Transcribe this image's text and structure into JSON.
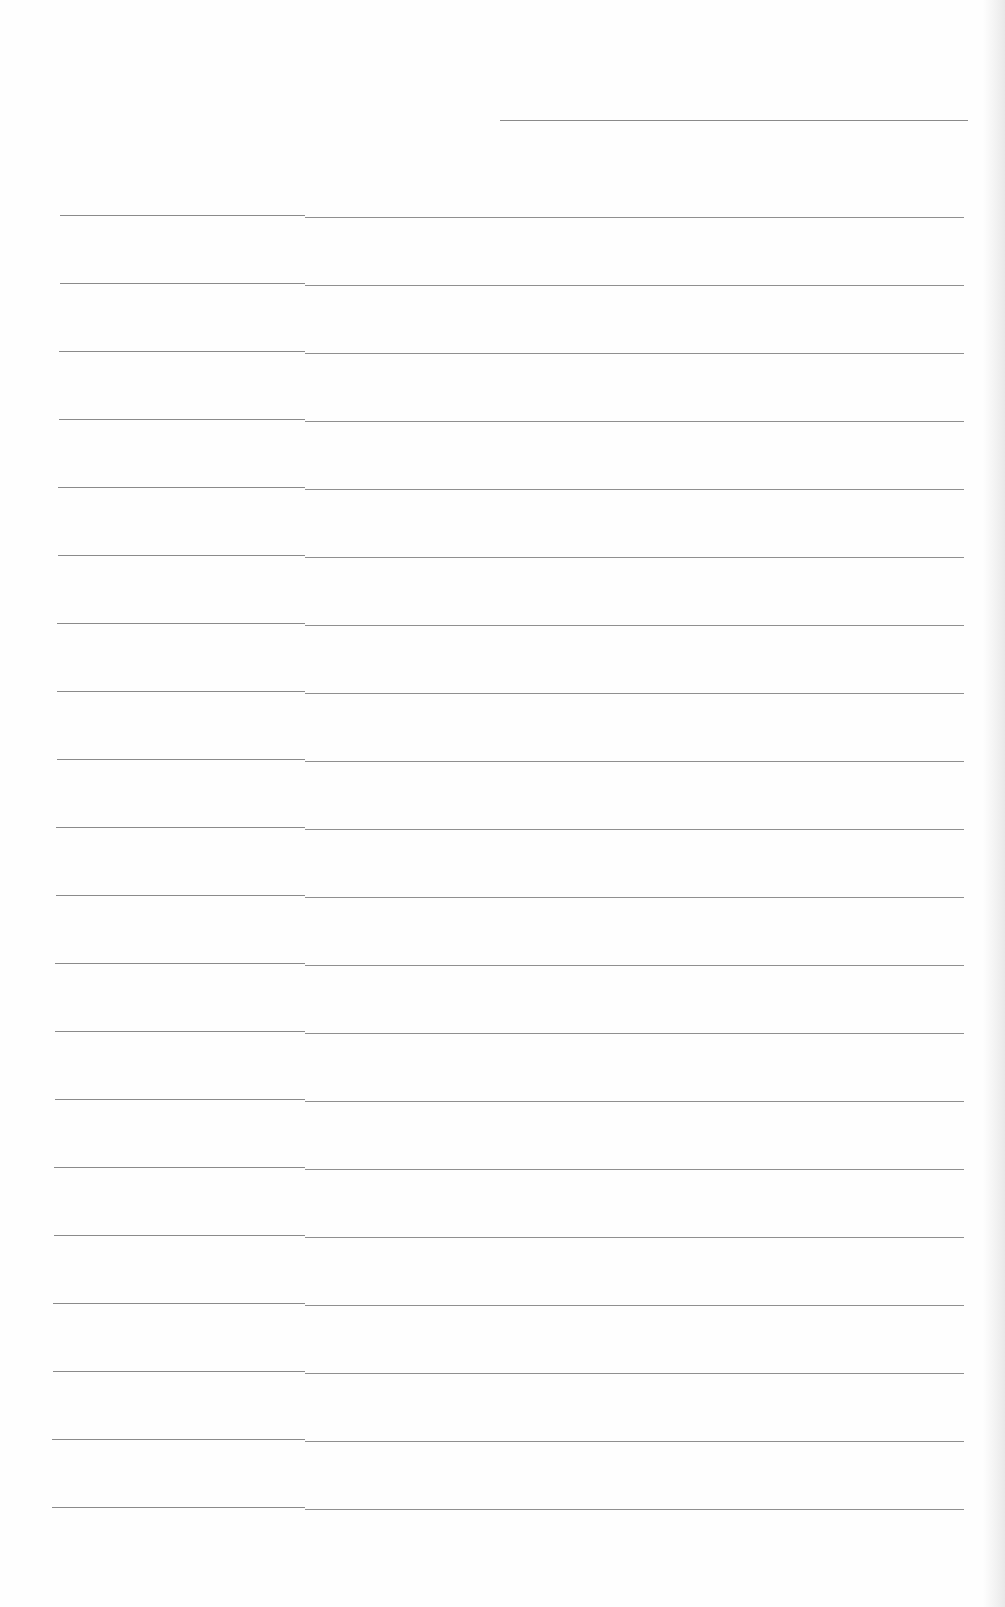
{
  "document": {
    "type": "lined-paper",
    "background": "#fefefe",
    "line_color": "#8a8a8a",
    "header_rule": {
      "x1": 500,
      "x2": 968,
      "y": 120
    },
    "rules": {
      "count": 20,
      "first_y": 215,
      "spacing": 68,
      "left_x_top": 60,
      "left_x_bottom": 52,
      "right_x": 964,
      "step_x": 305
    },
    "text": []
  }
}
